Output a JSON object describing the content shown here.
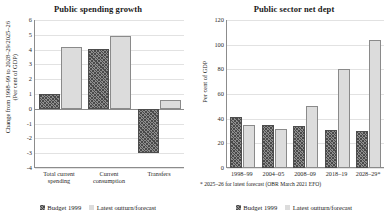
{
  "figure": {
    "legend": [
      {
        "label": "Budget 1999",
        "style": "hatch"
      },
      {
        "label": "Latest outturn/forecast",
        "style": "light"
      }
    ],
    "series_colors": {
      "budget_1999": "#8e8e8e",
      "latest": "#dcdcdc",
      "axis": "#8c8c8c",
      "grid": "#e2e2e2"
    },
    "footnote": "* 2025–26 for latest forecast (OBR March 2021 EFO)"
  },
  "chart_data": [
    {
      "type": "bar",
      "title": "Public spending growth",
      "xlabel": "",
      "ylabel": "Change from 1998–99 to 2028–29/2025–26",
      "ylabel_line2": "(Per cent of GDP)",
      "categories": [
        "Total current spending",
        "Current consumption",
        "Transfers"
      ],
      "category_lines": [
        [
          "Total current",
          "spending"
        ],
        [
          "Current",
          "consumption"
        ],
        [
          "Transfers",
          ""
        ]
      ],
      "series": [
        {
          "name": "Budget 1999",
          "values": [
            1.0,
            4.05,
            -3.0
          ]
        },
        {
          "name": "Latest outturn/forecast",
          "values": [
            4.15,
            4.9,
            0.6
          ]
        }
      ],
      "ylim": [
        -4,
        6
      ],
      "yticks": [
        6,
        5,
        4,
        3,
        2,
        1,
        0,
        -1,
        -2,
        -3,
        -4
      ],
      "ytick_labels": [
        "6",
        "5",
        "4",
        "3",
        "2",
        "1",
        "0",
        "-1",
        "-2",
        "-3",
        "-4"
      ],
      "grid": true,
      "legend_position": "bottom"
    },
    {
      "type": "bar",
      "title": "Public sector net dept",
      "xlabel": "",
      "ylabel": "Per cent of GDP",
      "categories": [
        "1998–99",
        "2004–05",
        "2008–09",
        "2018–19",
        "2028–29*"
      ],
      "category_lines": [
        [
          "1998–99",
          ""
        ],
        [
          "2004–05",
          ""
        ],
        [
          "2008–09",
          ""
        ],
        [
          "2018–19",
          ""
        ],
        [
          "2028–29*",
          ""
        ]
      ],
      "series": [
        {
          "name": "Budget 1999",
          "values": [
            41,
            35,
            34,
            31,
            30
          ]
        },
        {
          "name": "Latest outturn/forecast",
          "values": [
            35,
            32,
            50,
            80,
            104
          ]
        }
      ],
      "ylim": [
        0,
        120
      ],
      "yticks": [
        120,
        100,
        80,
        60,
        40,
        20,
        0
      ],
      "ytick_labels": [
        "120",
        "100",
        "80",
        "60",
        "40",
        "20",
        "0"
      ],
      "grid": true,
      "legend_position": "bottom"
    }
  ]
}
